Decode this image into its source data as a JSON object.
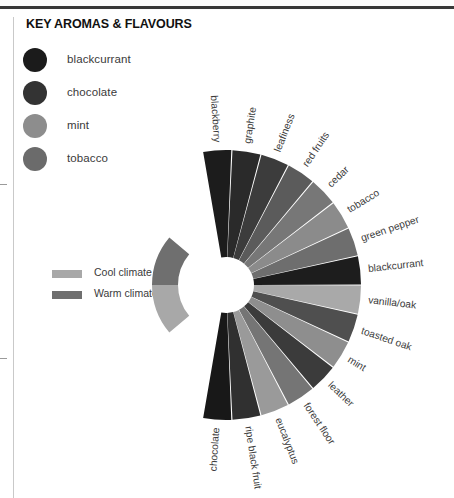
{
  "header": {
    "title": "KEY AROMAS & FLAVOURS"
  },
  "aroma_legend": {
    "items": [
      {
        "label": "blackcurrant",
        "color": "#1b1b1b"
      },
      {
        "label": "chocolate",
        "color": "#333333"
      },
      {
        "label": "mint",
        "color": "#8d8d8d"
      },
      {
        "label": "tobacco",
        "color": "#6b6b6b"
      }
    ]
  },
  "climate_legend": {
    "items": [
      {
        "label": "Cool climate",
        "color": "#a8a8a8"
      },
      {
        "label": "Warm climate",
        "color": "#6f6f6f"
      }
    ]
  },
  "chart_data": {
    "type": "pie",
    "title": "KEY AROMAS & FLAVOURS",
    "subtitle": "",
    "xlabel": "",
    "ylabel": "",
    "layout": {
      "shape": "fan",
      "center_x": 226,
      "center_y": 285,
      "inner_radius": 28,
      "outer_radius": 135,
      "start_angle_deg": -100,
      "end_angle_deg": 100,
      "legend_position": "top-left",
      "grid": false,
      "labels_radial": true
    },
    "categories": [
      "blackberry",
      "graphite",
      "leafiness",
      "red fruits",
      "cedar",
      "tobacco",
      "green pepper",
      "blackcurrant",
      "vanilla/oak",
      "toasted oak",
      "mint",
      "leather",
      "forest floor",
      "eucalyptus",
      "ripe black fruit",
      "chocolate"
    ],
    "values": [
      1,
      1,
      1,
      1,
      1,
      1,
      1,
      1,
      1,
      1,
      1,
      1,
      1,
      1,
      1,
      1
    ],
    "colors": [
      "#1c1c1c",
      "#2a2a2a",
      "#3c3c3c",
      "#5b5b5b",
      "#777777",
      "#8b8b8b",
      "#6e6e6e",
      "#1d1d1d",
      "#a9a9a9",
      "#4f4f4f",
      "#8e8e8e",
      "#3b3b3b",
      "#757575",
      "#9a9a9a",
      "#303030",
      "#181818"
    ],
    "climate_arc": {
      "inner_radius": 48,
      "outer_radius": 74,
      "segments": [
        {
          "name": "Cool climate",
          "color": "#a8a8a8",
          "start_angle_deg": 140,
          "end_angle_deg": 180
        },
        {
          "name": "Warm climate",
          "color": "#6f6f6f",
          "start_angle_deg": 180,
          "end_angle_deg": 220
        }
      ]
    }
  }
}
